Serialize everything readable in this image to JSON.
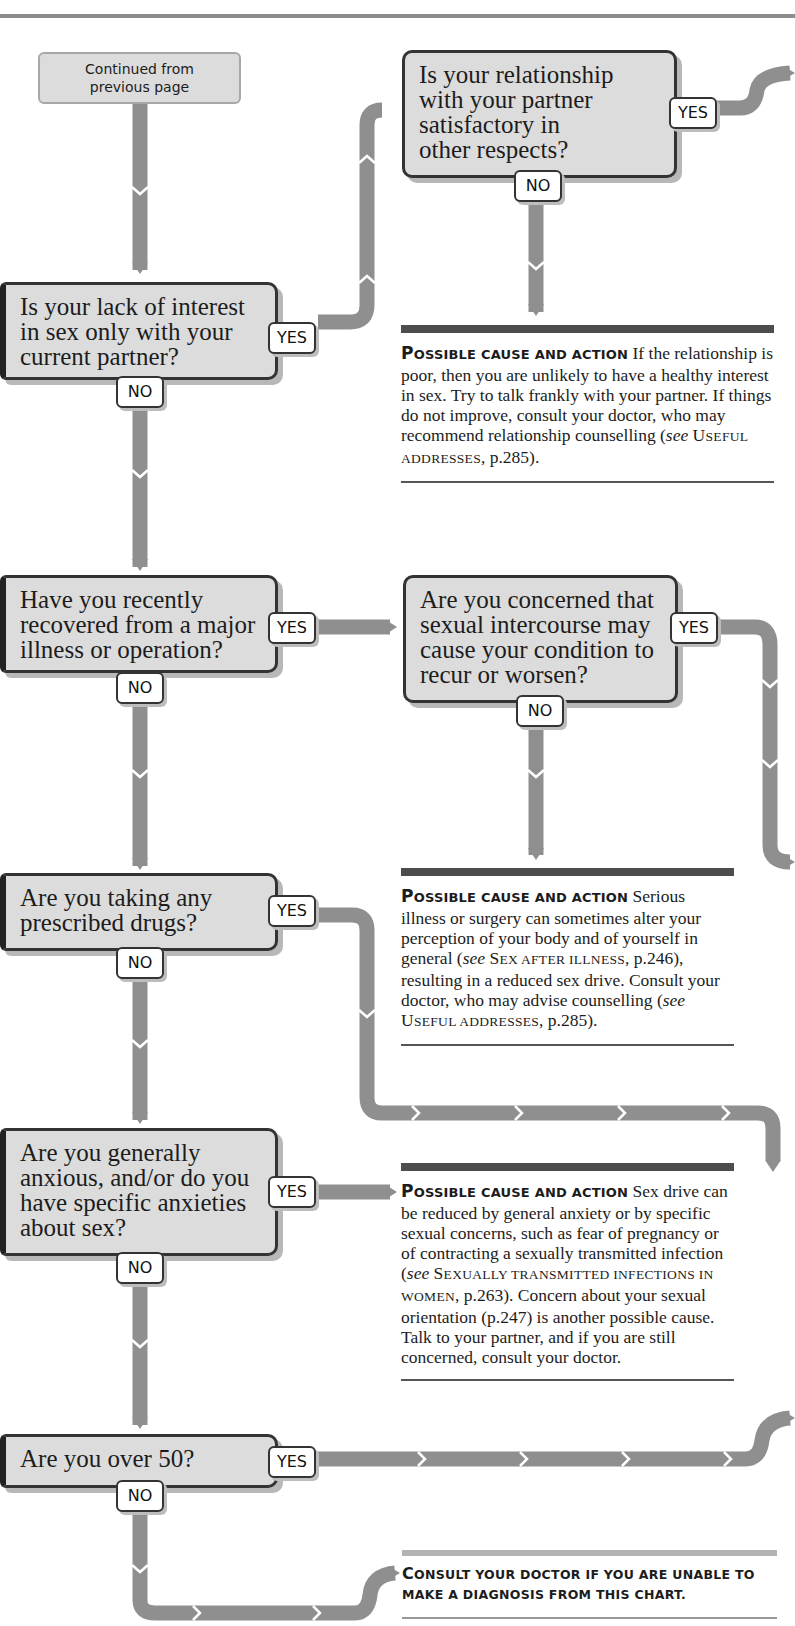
{
  "start": {
    "label": "Continued from\nprevious page"
  },
  "labels": {
    "yes": "YES",
    "no": "NO"
  },
  "questions": [
    {
      "id": "q1",
      "text": "Is your lack of interest\nin sex only with your\ncurrent partner?"
    },
    {
      "id": "q1b",
      "text": "Is your relationship\nwith your partner\nsatisfactory in\nother respects?"
    },
    {
      "id": "q2",
      "text": "Have you recently\nrecovered from a major\nillness or operation?"
    },
    {
      "id": "q2b",
      "text": "Are you concerned that\nsexual intercourse may\ncause your condition to\nrecur or worsen?"
    },
    {
      "id": "q3",
      "text": "Are you taking any\nprescribed drugs?"
    },
    {
      "id": "q4",
      "text": "Are you generally\nanxious, and/or do you\nhave specific anxieties\nabout sex?"
    },
    {
      "id": "q5",
      "text": "Are you over 50?"
    }
  ],
  "answers": [
    {
      "lead_first": "P",
      "lead_rest": "OSSIBLE CAUSE AND ACTION",
      "text_1": " If the relationship is poor, then you are unlikely to have a healthy interest in sex. Try to talk frankly with your partner. If things do not improve, consult your doctor, who may recommend relationship counselling (",
      "see": "see",
      "ref_first": "U",
      "ref_rest": "SEFUL ADDRESSES",
      "text_2": ", p.285)."
    },
    {
      "lead_first": "P",
      "lead_rest": "OSSIBLE CAUSE AND ACTION",
      "text_1": " Serious illness or surgery can sometimes alter your perception of your body and of yourself in general (",
      "see": "see",
      "ref_first": "S",
      "ref_rest": "EX AFTER ILLNESS",
      "text_2": ", p.246), resulting in a reduced sex drive. Consult your doctor, who may advise counselling (",
      "see_2": "see",
      "ref2_first": "U",
      "ref2_rest": "SEFUL ADDRESSES",
      "text_3": ", p.285)."
    },
    {
      "lead_first": "P",
      "lead_rest": "OSSIBLE CAUSE AND ACTION",
      "text_1": " Sex drive can be reduced by general anxiety or by specific sexual concerns, such as fear of pregnancy or of contracting a sexually transmitted infection (",
      "see": "see",
      "ref_first": "S",
      "ref_rest": "EXUALLY TRANSMITTED INFECTIONS IN WOMEN",
      "text_2": ", p.263). Concern about your sexual orientation (p.247) is another possible cause. Talk to your partner, and if you are still concerned, consult your doctor."
    }
  ],
  "final": {
    "first": "C",
    "rest": "ONSULT YOUR DOCTOR IF YOU ARE UNABLE TO MAKE A DIAGNOSIS FROM THIS CHART."
  },
  "colors": {
    "connector": "#8f8f8f",
    "box_fill": "#dcdcdc",
    "box_border": "#333333",
    "rule_dark": "#4d4d4d",
    "rule_light": "#b3b3b3"
  }
}
